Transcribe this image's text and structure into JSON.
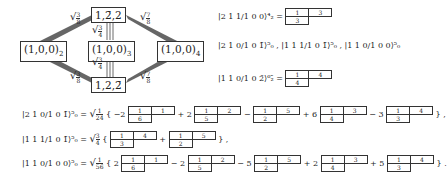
{
  "diagram": {
    "nodes": {
      "top": "1,2̄,2",
      "bottom": "1,2,2̄",
      "left": "(1,0,0)",
      "left_sub": "2",
      "center": "(1,0,0)",
      "center_sub": "3",
      "right": "(1,0,0)",
      "right_sub": "4"
    },
    "weights": {
      "left": {
        "num": "3",
        "den": "8"
      },
      "center": {
        "num": "3",
        "den": "4"
      },
      "right": {
        "num": "7",
        "den": "8"
      }
    }
  },
  "right_states": [
    {
      "label": "|2 1 1/1 0 0⟩⁴₂",
      "equals": "=",
      "tableau": [
        [
          "1",
          "3"
        ],
        [
          "3"
        ]
      ]
    },
    {
      "label": "|2 1 0/1 0 1̄⟩⁵₀ , |1 1 1/1 0 1̄⟩⁵₀ , |1 1 0/1 0 0⟩⁵₀"
    },
    {
      "label": "|1 1 0/1 0 2̄⟩⁶₂̄",
      "equals": "=",
      "tableau": [
        [
          "1",
          "4"
        ],
        [
          "4"
        ]
      ]
    }
  ],
  "equations": [
    {
      "lhs": "|2 1 0/1 0 1̄⟩⁵₀",
      "prefactor": {
        "num": "1",
        "den": "24"
      },
      "terms": [
        {
          "coef": "−2",
          "tableau": [
            [
              "1",
              "1"
            ],
            [
              "6"
            ]
          ]
        },
        {
          "coef": "+ 2",
          "tableau": [
            [
              "1",
              "2"
            ],
            [
              "5"
            ]
          ]
        },
        {
          "coef": "−",
          "tableau": [
            [
              "1",
              "5"
            ],
            [
              "2"
            ]
          ]
        },
        {
          "coef": "+ 6",
          "tableau": [
            [
              "1",
              "3"
            ],
            [
              "4"
            ]
          ]
        },
        {
          "coef": "− 3",
          "tableau": [
            [
              "1",
              "4"
            ],
            [
              "3"
            ]
          ]
        }
      ],
      "end": "} ,"
    },
    {
      "lhs": "|1 1 1/1 0 1̄⟩⁵₀",
      "prefactor": {
        "num": "3",
        "den": "4"
      },
      "terms": [
        {
          "coef": "",
          "tableau": [
            [
              "1",
              "4"
            ],
            [
              "3"
            ]
          ]
        },
        {
          "coef": "+",
          "tableau": [
            [
              "1",
              "5"
            ],
            [
              "2"
            ]
          ]
        }
      ],
      "end": "} ,"
    },
    {
      "lhs": "|1 1 0/1 0 0⟩⁵₀",
      "prefactor": {
        "num": "1",
        "den": "56"
      },
      "terms": [
        {
          "coef": "2",
          "tableau": [
            [
              "1",
              "1"
            ],
            [
              "6"
            ]
          ]
        },
        {
          "coef": "− 2",
          "tableau": [
            [
              "1",
              "2"
            ],
            [
              "5"
            ]
          ]
        },
        {
          "coef": "− 5",
          "tableau": [
            [
              "1",
              "5"
            ],
            [
              "2"
            ]
          ]
        },
        {
          "coef": "+ 2",
          "tableau": [
            [
              "1",
              "3"
            ],
            [
              "4"
            ]
          ]
        },
        {
          "coef": "+ 5",
          "tableau": [
            [
              "1",
              "4"
            ],
            [
              "3"
            ]
          ]
        }
      ],
      "end": "} ."
    }
  ]
}
